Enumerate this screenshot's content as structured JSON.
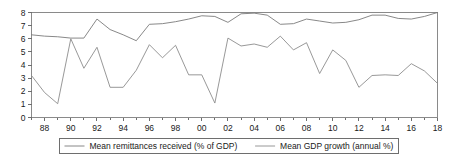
{
  "chart_data": {
    "type": "line",
    "title": "",
    "subtitle": "",
    "xlabel": "",
    "ylabel": "",
    "xlim": [
      1987,
      2018
    ],
    "ylim": [
      0,
      8
    ],
    "yticks": [
      "0",
      "1",
      "2",
      "3",
      "4",
      "5",
      "6",
      "7",
      "8"
    ],
    "ytick_values": [
      0,
      1,
      2,
      3,
      4,
      5,
      6,
      7,
      8
    ],
    "xticks": [
      "88",
      "90",
      "92",
      "94",
      "96",
      "98",
      "00",
      "02",
      "04",
      "06",
      "08",
      "10",
      "12",
      "14",
      "16",
      "18"
    ],
    "xtick_values": [
      1988,
      1990,
      1992,
      1994,
      1996,
      1998,
      2000,
      2002,
      2004,
      2006,
      2008,
      2010,
      2012,
      2014,
      2016,
      2018
    ],
    "grid": false,
    "legend_position": "bottom",
    "x": [
      1987,
      1988,
      1989,
      1990,
      1991,
      1992,
      1993,
      1994,
      1995,
      1996,
      1997,
      1998,
      1999,
      2000,
      2001,
      2002,
      2003,
      2004,
      2005,
      2006,
      2007,
      2008,
      2009,
      2010,
      2011,
      2012,
      2013,
      2014,
      2015,
      2016,
      2017,
      2018
    ],
    "series": [
      {
        "name": "Mean remittances received (% of GDP)",
        "color": "#7a7a7a",
        "values": [
          6.3,
          6.2,
          6.15,
          6.05,
          6.05,
          7.5,
          6.7,
          6.3,
          5.85,
          7.1,
          7.15,
          7.3,
          7.5,
          7.75,
          7.7,
          7.25,
          7.9,
          7.95,
          7.8,
          7.1,
          7.15,
          7.5,
          7.35,
          7.2,
          7.25,
          7.45,
          7.8,
          7.8,
          7.55,
          7.5,
          7.7,
          8.0
        ]
      },
      {
        "name": "Mean GDP growth (annual %)",
        "color": "#8c8c8c",
        "values": [
          3.2,
          1.9,
          1.05,
          6.0,
          3.75,
          5.35,
          2.3,
          2.3,
          3.6,
          5.55,
          4.55,
          5.5,
          3.25,
          3.25,
          1.1,
          6.05,
          5.45,
          5.6,
          5.35,
          6.2,
          5.15,
          5.7,
          3.35,
          5.15,
          4.35,
          2.3,
          3.2,
          3.25,
          3.2,
          4.1,
          3.55,
          2.6
        ]
      }
    ]
  },
  "legend": {
    "entries": [
      {
        "label": "Mean remittances received (% of GDP)"
      },
      {
        "label": "Mean GDP growth (annual %)"
      }
    ]
  }
}
